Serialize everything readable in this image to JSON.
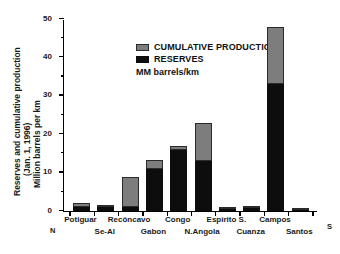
{
  "chart_data": {
    "type": "bar",
    "title": "",
    "subtitle": "",
    "stacked": true,
    "xlabel": "",
    "ylabel": "Reserves and cumulative production (Jan. 1, 1996) Million barrels per km",
    "ylabel_lines": [
      "Reserves and cumulative production",
      "(Jan. 1, 1996)",
      "Million barrels per km"
    ],
    "units_note": "MM barrels/km",
    "ylim": [
      0,
      50
    ],
    "yticks": [
      0,
      10,
      20,
      30,
      40,
      50
    ],
    "ytick_labels": [
      "0",
      "10",
      "20",
      "30",
      "40",
      "50"
    ],
    "yticks_minor": [
      5,
      15,
      25,
      35,
      45
    ],
    "grid": false,
    "legend_position": "top-left",
    "axis_end_labels": {
      "left": "N",
      "right": "S"
    },
    "categories": [
      "Potiguar",
      "Se-Al",
      "Recôncavo",
      "Gabon",
      "Congo",
      "N.Angola",
      "Espírito S.",
      "Cuanza",
      "Campos",
      "Santos"
    ],
    "category_label_rows": [
      0,
      1,
      0,
      1,
      0,
      1,
      0,
      1,
      0,
      1
    ],
    "series": [
      {
        "name": "RESERVES",
        "color": "#0d0d0d",
        "values": [
          1.0,
          1.0,
          1.0,
          11.0,
          16.0,
          13.0,
          0.5,
          0.9,
          33.0,
          0.15
        ]
      },
      {
        "name": "CUMULATIVE PRODUCTION",
        "color": "#7d7d7d",
        "values": [
          1.1,
          0.5,
          7.8,
          2.3,
          1.0,
          10.0,
          0.3,
          0.3,
          15.0,
          0.15
        ]
      }
    ],
    "totals": [
      2.1,
      1.5,
      8.8,
      13.3,
      17.0,
      23.0,
      0.8,
      1.2,
      48.0,
      0.3
    ],
    "legend": [
      "CUMULATIVE PRODUCTION",
      "RESERVES"
    ]
  },
  "colors": {
    "reserves": "#0d0d0d",
    "cumulative_production": "#7d7d7d",
    "axis": "#000000",
    "background": "#ffffff"
  }
}
